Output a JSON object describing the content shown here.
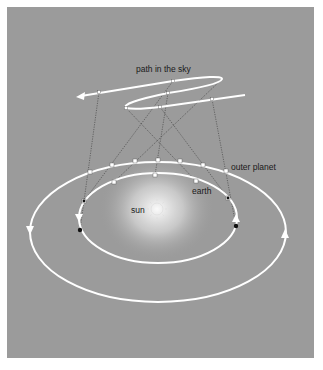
{
  "labels": {
    "path_in_the_sky": "path in the sky",
    "outer_planet": "outer planet",
    "earth": "earth",
    "sun": "sun"
  },
  "colors": {
    "background": "#ffffff",
    "panel": "#9b9b9b",
    "orbit": "#ffffff",
    "sight_line": "#3a3a3a",
    "marker": "#ffffff",
    "earth_dark_marker": "#111111",
    "sun_glow": "#f4f4f4"
  },
  "diagram": {
    "outer_orbit": {
      "cx": 158,
      "cy": 232,
      "rx": 128,
      "ry": 70
    },
    "earth_orbit": {
      "cx": 158,
      "cy": 218,
      "rx": 79,
      "ry": 45
    },
    "sun": {
      "cx": 157,
      "cy": 209,
      "r": 6
    },
    "outer_planet_positions": [
      [
        90,
        172
      ],
      [
        112,
        165
      ],
      [
        135,
        161
      ],
      [
        158,
        160
      ],
      [
        180,
        161
      ],
      [
        203,
        165
      ],
      [
        226,
        171
      ]
    ],
    "earth_positions": [
      [
        84,
        201
      ],
      [
        114,
        182
      ],
      [
        155,
        175
      ],
      [
        196,
        181
      ],
      [
        228,
        198
      ]
    ],
    "sky_positions": [
      [
        99,
        92
      ],
      [
        173,
        81
      ],
      [
        168,
        93
      ],
      [
        126,
        108
      ],
      [
        160,
        107
      ],
      [
        212,
        99
      ]
    ]
  }
}
